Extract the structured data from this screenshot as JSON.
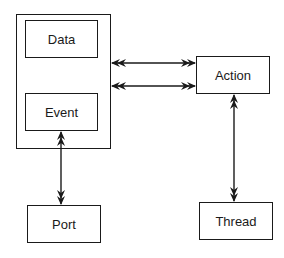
{
  "diagram": {
    "type": "block-diagram",
    "container": {
      "name": "data-event-group",
      "children": [
        "Data",
        "Event"
      ]
    },
    "nodes": [
      {
        "id": "data",
        "label": "Data"
      },
      {
        "id": "event",
        "label": "Event"
      },
      {
        "id": "action",
        "label": "Action"
      },
      {
        "id": "port",
        "label": "Port"
      },
      {
        "id": "thread",
        "label": "Thread"
      }
    ],
    "edges": [
      {
        "from": "container",
        "to": "action",
        "style": "double-headed-bidirectional"
      },
      {
        "from": "container",
        "to": "action",
        "style": "double-headed-bidirectional"
      },
      {
        "from": "event",
        "to": "port",
        "style": "double-headed-bidirectional"
      },
      {
        "from": "action",
        "to": "thread",
        "style": "double-headed-bidirectional"
      }
    ],
    "colors": {
      "stroke": "#1a1a1a",
      "background": "#ffffff"
    }
  }
}
